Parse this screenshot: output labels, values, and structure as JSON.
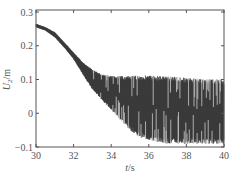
{
  "chart_data": {
    "type": "line",
    "title": "",
    "xlabel": "t/s",
    "ylabel": "U2/m",
    "xlabel_parts": {
      "var": "t",
      "unit": "/s"
    },
    "ylabel_parts": {
      "var": "U",
      "sub": "2",
      "unit": "/m"
    },
    "xlim": [
      30,
      40
    ],
    "ylim": [
      -0.1,
      0.3
    ],
    "xticks": [
      30,
      32,
      34,
      36,
      38,
      40
    ],
    "yticks": [
      -0.1,
      0,
      0.1,
      0.2,
      0.3
    ],
    "xtick_labels": [
      "30",
      "32",
      "34",
      "36",
      "38",
      "40"
    ],
    "ytick_labels": [
      "−0.1",
      "0",
      "0.1",
      "0.2",
      "0.3"
    ],
    "grid": false,
    "legend": null,
    "line_color": "#333333",
    "envelope": {
      "t": [
        30,
        30.5,
        31,
        31.5,
        32,
        32.5,
        33,
        33.5,
        34,
        34.5,
        35,
        35.5,
        36,
        37,
        38,
        39,
        40
      ],
      "upper": [
        0.265,
        0.255,
        0.24,
        0.21,
        0.18,
        0.15,
        0.13,
        0.115,
        0.11,
        0.11,
        0.11,
        0.112,
        0.112,
        0.11,
        0.105,
        0.1,
        0.1
      ],
      "lower": [
        0.255,
        0.245,
        0.225,
        0.195,
        0.16,
        0.115,
        0.07,
        0.04,
        0.01,
        -0.02,
        -0.05,
        -0.07,
        -0.08,
        -0.09,
        -0.09,
        -0.09,
        -0.09
      ]
    }
  }
}
